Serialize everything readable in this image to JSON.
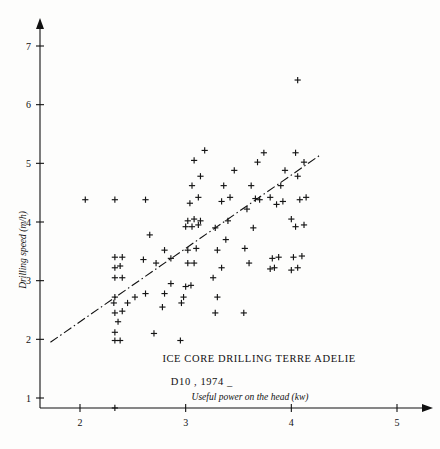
{
  "chart_data": {
    "type": "scatter",
    "title": "",
    "xlabel": "Useful power on the head (kw)",
    "ylabel": "Drilling speed  (m/h)",
    "xlim": [
      1.55,
      5.35
    ],
    "ylim": [
      0.4,
      7.45
    ],
    "xticks": [
      2,
      3,
      4,
      5
    ],
    "yticks": [
      1,
      2,
      3,
      4,
      5,
      6,
      7
    ],
    "xticklabels": [
      "2",
      "3",
      "4",
      "5"
    ],
    "yticklabels": [
      "1",
      "2",
      "3",
      "4",
      "5",
      "6",
      "7"
    ],
    "grid": false,
    "legend": null,
    "marker": "plus",
    "annotations": [
      {
        "text": "ICE CORE DRILLING TERRE ADELIE",
        "x": 2.78,
        "y": 1.62
      },
      {
        "text": "D10 , 1974 _",
        "x": 2.86,
        "y": 1.22
      }
    ],
    "trendline": {
      "style": "dash-dot",
      "x": [
        1.72,
        4.28
      ],
      "y": [
        1.95,
        5.15
      ]
    },
    "points": [
      [
        2.33,
        0.83
      ],
      [
        2.33,
        1.98
      ],
      [
        2.38,
        1.98
      ],
      [
        2.33,
        2.12
      ],
      [
        2.36,
        2.3
      ],
      [
        2.33,
        2.45
      ],
      [
        2.4,
        2.48
      ],
      [
        2.32,
        2.62
      ],
      [
        2.45,
        2.62
      ],
      [
        2.33,
        2.72
      ],
      [
        2.52,
        2.72
      ],
      [
        2.62,
        2.78
      ],
      [
        2.33,
        3.05
      ],
      [
        2.4,
        3.05
      ],
      [
        2.33,
        3.22
      ],
      [
        2.38,
        3.25
      ],
      [
        2.33,
        3.4
      ],
      [
        2.4,
        3.4
      ],
      [
        2.6,
        3.36
      ],
      [
        2.33,
        4.38
      ],
      [
        2.05,
        4.38
      ],
      [
        2.7,
        2.1
      ],
      [
        2.78,
        2.55
      ],
      [
        2.8,
        2.78
      ],
      [
        2.86,
        2.95
      ],
      [
        2.72,
        3.3
      ],
      [
        2.86,
        3.38
      ],
      [
        2.8,
        3.52
      ],
      [
        2.66,
        3.78
      ],
      [
        2.62,
        4.38
      ],
      [
        2.95,
        1.98
      ],
      [
        2.96,
        2.62
      ],
      [
        2.98,
        2.72
      ],
      [
        3.0,
        2.9
      ],
      [
        3.05,
        2.92
      ],
      [
        3.02,
        3.3
      ],
      [
        3.08,
        3.3
      ],
      [
        3.02,
        3.52
      ],
      [
        3.1,
        3.55
      ],
      [
        3.0,
        3.92
      ],
      [
        3.06,
        3.92
      ],
      [
        3.12,
        3.95
      ],
      [
        3.02,
        4.02
      ],
      [
        3.08,
        4.05
      ],
      [
        3.14,
        4.02
      ],
      [
        3.04,
        4.32
      ],
      [
        3.12,
        4.42
      ],
      [
        3.06,
        4.62
      ],
      [
        3.14,
        4.78
      ],
      [
        3.08,
        5.05
      ],
      [
        3.18,
        5.22
      ],
      [
        3.28,
        2.45
      ],
      [
        3.3,
        2.72
      ],
      [
        3.26,
        3.05
      ],
      [
        3.34,
        3.22
      ],
      [
        3.3,
        3.52
      ],
      [
        3.38,
        3.7
      ],
      [
        3.28,
        3.9
      ],
      [
        3.4,
        4.02
      ],
      [
        3.34,
        4.35
      ],
      [
        3.42,
        4.42
      ],
      [
        3.36,
        4.62
      ],
      [
        3.46,
        4.88
      ],
      [
        3.55,
        2.45
      ],
      [
        3.6,
        3.3
      ],
      [
        3.56,
        3.55
      ],
      [
        3.64,
        3.9
      ],
      [
        3.58,
        4.22
      ],
      [
        3.66,
        4.4
      ],
      [
        3.7,
        4.38
      ],
      [
        3.62,
        4.62
      ],
      [
        3.68,
        5.02
      ],
      [
        3.74,
        5.18
      ],
      [
        3.8,
        3.2
      ],
      [
        3.84,
        3.22
      ],
      [
        3.82,
        3.38
      ],
      [
        3.88,
        3.4
      ],
      [
        3.86,
        4.3
      ],
      [
        3.92,
        4.35
      ],
      [
        3.8,
        4.42
      ],
      [
        3.9,
        4.62
      ],
      [
        3.94,
        4.88
      ],
      [
        4.0,
        3.18
      ],
      [
        4.06,
        3.22
      ],
      [
        4.02,
        3.4
      ],
      [
        4.1,
        3.42
      ],
      [
        4.04,
        3.92
      ],
      [
        4.12,
        3.95
      ],
      [
        4.0,
        4.05
      ],
      [
        4.08,
        4.38
      ],
      [
        4.14,
        4.42
      ],
      [
        4.06,
        4.78
      ],
      [
        4.12,
        5.02
      ],
      [
        4.04,
        5.18
      ],
      [
        4.06,
        6.42
      ]
    ]
  }
}
